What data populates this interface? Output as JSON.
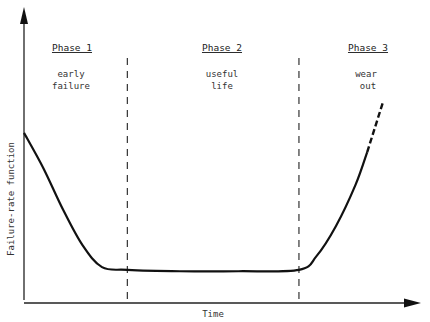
{
  "chart_data": {
    "type": "line",
    "title": "",
    "xlabel": "Time",
    "ylabel": "Failure-rate function",
    "grid": false,
    "phases": [
      {
        "title": "Phase 1",
        "line1": "early",
        "line2": "failure"
      },
      {
        "title": "Phase 2",
        "line1": "useful",
        "line2": "life"
      },
      {
        "title": "Phase 3",
        "line1": "wear",
        "line2": "out"
      }
    ],
    "xlim": [
      0,
      100
    ],
    "ylim": [
      0,
      100
    ],
    "phase_boundaries_x": [
      26.5,
      70.5
    ],
    "series": [
      {
        "name": "failure rate (solid)",
        "x": [
          0,
          5,
          10,
          15,
          20,
          26.5,
          40,
          55,
          70.5,
          75,
          80,
          85,
          88
        ],
        "y": [
          61,
          48,
          33,
          20,
          12,
          11,
          10.5,
          10.5,
          11,
          16,
          27,
          42,
          54
        ]
      },
      {
        "name": "failure rate (extrapolated, dashed)",
        "x": [
          88,
          92
        ],
        "y": [
          54,
          72
        ]
      }
    ]
  }
}
